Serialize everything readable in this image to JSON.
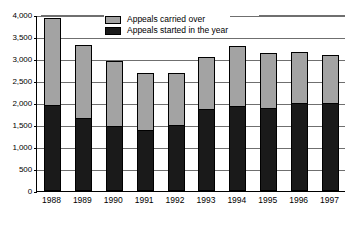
{
  "chart_data": {
    "type": "bar",
    "subtype": "stacked-vertical",
    "title": "",
    "xlabel": "",
    "ylabel": "",
    "ylim": [
      0,
      4000
    ],
    "ytick_step": 500,
    "yticks": [
      "0",
      "500",
      "1,000",
      "1,500",
      "2,000",
      "2,500",
      "3,000",
      "3,500",
      "4,000"
    ],
    "ytick_values": [
      0,
      500,
      1000,
      1500,
      2000,
      2500,
      3000,
      3500,
      4000
    ],
    "grid": true,
    "legend_position": "top-center",
    "categories": [
      "1988",
      "1989",
      "1990",
      "1991",
      "1992",
      "1993",
      "1994",
      "1995",
      "1996",
      "1997"
    ],
    "series": [
      {
        "name": "Appeals started in the year",
        "color": "#1a1a1a",
        "values": [
          1950,
          1650,
          1470,
          1390,
          1500,
          1870,
          1940,
          1890,
          2000,
          2010
        ]
      },
      {
        "name": "Appeals carried over",
        "color": "#a3a3a3",
        "values": [
          1980,
          1670,
          1480,
          1300,
          1180,
          1190,
          1360,
          1260,
          1160,
          1080
        ]
      }
    ],
    "totals": [
      3930,
      3320,
      2950,
      2690,
      2680,
      3060,
      3300,
      3150,
      3160,
      3090
    ]
  },
  "legend": {
    "entries": [
      {
        "label": "Appeals carried over",
        "swatch": "carried"
      },
      {
        "label": "Appeals started in the year",
        "swatch": "started"
      }
    ]
  },
  "colors": {
    "carried_over": "#a3a3a3",
    "started_in_year": "#1a1a1a",
    "gridline": "#6f6f6f",
    "axis": "#000000",
    "background": "#ffffff"
  }
}
